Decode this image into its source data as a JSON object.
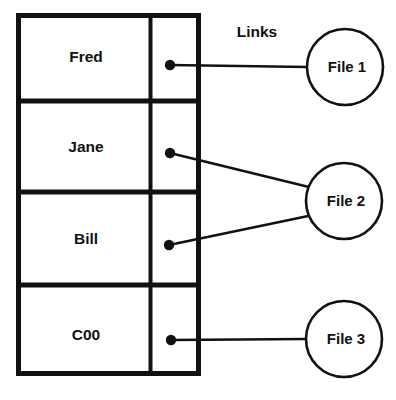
{
  "diagram": {
    "title_label": "Links",
    "colors": {
      "stroke": "#111111",
      "background": "#ffffff",
      "text": "#111111"
    },
    "table": {
      "x": 16,
      "y": 13,
      "width": 183,
      "height": 363,
      "column_divider_x": 150,
      "row_divider_ys": [
        101,
        192,
        285
      ],
      "rows": [
        {
          "name": "Fred",
          "link_dot": {
            "x": 170,
            "y": 65
          },
          "target": "File 1"
        },
        {
          "name": "Jane",
          "link_dot": {
            "x": 170,
            "y": 153
          },
          "target": "File 2"
        },
        {
          "name": "Bill",
          "link_dot": {
            "x": 169,
            "y": 245
          },
          "target": "File 2"
        },
        {
          "name": "C00",
          "link_dot": {
            "x": 171,
            "y": 340
          },
          "target": "File 3"
        }
      ]
    },
    "files": [
      {
        "label": "File 1",
        "cx": 345,
        "cy": 67,
        "r": 38
      },
      {
        "label": "File 2",
        "cx": 344,
        "cy": 201,
        "r": 38
      },
      {
        "label": "File 3",
        "cx": 344,
        "cy": 339,
        "r": 38
      }
    ],
    "links": [
      {
        "from_row": "Fred",
        "to_file": "File 1",
        "x1": 170,
        "y1": 65,
        "x2": 307,
        "y2": 67
      },
      {
        "from_row": "Jane",
        "to_file": "File 2",
        "x1": 170,
        "y1": 153,
        "x2": 312,
        "y2": 188
      },
      {
        "from_row": "Bill",
        "to_file": "File 2",
        "x1": 169,
        "y1": 245,
        "x2": 312,
        "y2": 216
      },
      {
        "from_row": "C00",
        "to_file": "File 3",
        "x1": 171,
        "y1": 340,
        "x2": 306,
        "y2": 339
      }
    ]
  }
}
